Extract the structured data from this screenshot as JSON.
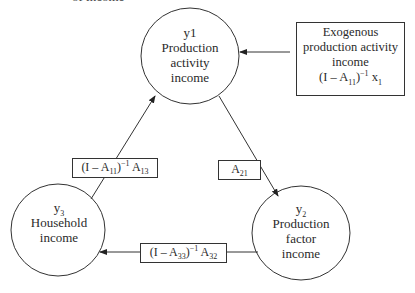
{
  "header": {
    "clipped_text": "of income"
  },
  "nodes": {
    "y1": {
      "symbol": "y1",
      "line1": "Production",
      "line2": "activity",
      "line3": "income"
    },
    "y2": {
      "symbol_base": "y",
      "symbol_sub": "2",
      "line1": "Production",
      "line2": "factor",
      "line3": "income"
    },
    "y3": {
      "symbol_base": "y",
      "symbol_sub": "3",
      "line1": "Household",
      "line2": "income"
    }
  },
  "exogenous": {
    "line1": "Exogenous",
    "line2": "production activity",
    "line3": "income",
    "formula": {
      "open": "(I – A",
      "sub1": "11",
      "close": ")",
      "sup": "−1",
      "var": " x",
      "sub2": "1"
    }
  },
  "edges": {
    "y3_to_y1": {
      "open": "(I – A",
      "sub1": "11",
      "close": ")",
      "sup": "−1",
      "var": " A",
      "sub2": "13"
    },
    "y1_to_y2": {
      "var": "A",
      "sub": "21"
    },
    "y2_to_y3": {
      "open": "(I – A",
      "sub1": "33",
      "close": ")",
      "sup": "−1",
      "var": " A",
      "sub2": "32"
    }
  },
  "colors": {
    "stroke": "#333333",
    "background": "#ffffff"
  }
}
